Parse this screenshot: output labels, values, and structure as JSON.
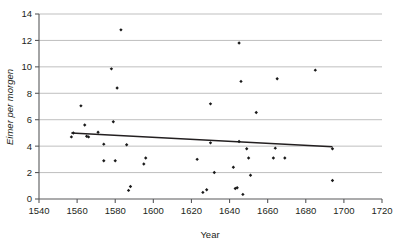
{
  "chart_data": {
    "type": "scatter",
    "title": "",
    "xlabel": "Year",
    "ylabel": "Eimer per morgen",
    "xlim": [
      1540,
      1720
    ],
    "ylim": [
      0,
      14
    ],
    "xticks": [
      1540,
      1560,
      1580,
      1600,
      1620,
      1640,
      1660,
      1680,
      1700,
      1720
    ],
    "yticks": [
      0,
      2,
      4,
      6,
      8,
      10,
      12,
      14
    ],
    "xtick_step": 20,
    "ytick_step": 2,
    "grid": "horizontal",
    "legend": "none",
    "marker": "small-filled-diamond",
    "marker_color": "#1a1a1a",
    "points": [
      {
        "x": 1557,
        "y": 4.7
      },
      {
        "x": 1558,
        "y": 5.0
      },
      {
        "x": 1562,
        "y": 7.05
      },
      {
        "x": 1564,
        "y": 5.6
      },
      {
        "x": 1565,
        "y": 4.75
      },
      {
        "x": 1566,
        "y": 4.7
      },
      {
        "x": 1571,
        "y": 5.05
      },
      {
        "x": 1574,
        "y": 4.15
      },
      {
        "x": 1574,
        "y": 2.9
      },
      {
        "x": 1578,
        "y": 9.85
      },
      {
        "x": 1579,
        "y": 5.85
      },
      {
        "x": 1580,
        "y": 2.9
      },
      {
        "x": 1581,
        "y": 8.4
      },
      {
        "x": 1583,
        "y": 12.8
      },
      {
        "x": 1586,
        "y": 4.1
      },
      {
        "x": 1587,
        "y": 0.65
      },
      {
        "x": 1588,
        "y": 0.95
      },
      {
        "x": 1595,
        "y": 2.65
      },
      {
        "x": 1596,
        "y": 3.1
      },
      {
        "x": 1623,
        "y": 3.0
      },
      {
        "x": 1626,
        "y": 0.5
      },
      {
        "x": 1628,
        "y": 0.7
      },
      {
        "x": 1630,
        "y": 7.2
      },
      {
        "x": 1630,
        "y": 4.25
      },
      {
        "x": 1632,
        "y": 2.0
      },
      {
        "x": 1642,
        "y": 2.4
      },
      {
        "x": 1643,
        "y": 0.8
      },
      {
        "x": 1644,
        "y": 0.85
      },
      {
        "x": 1645,
        "y": 4.35
      },
      {
        "x": 1645,
        "y": 11.8
      },
      {
        "x": 1646,
        "y": 8.9
      },
      {
        "x": 1647,
        "y": 0.35
      },
      {
        "x": 1649,
        "y": 3.8
      },
      {
        "x": 1650,
        "y": 3.1
      },
      {
        "x": 1651,
        "y": 1.8
      },
      {
        "x": 1654,
        "y": 6.55
      },
      {
        "x": 1663,
        "y": 3.1
      },
      {
        "x": 1664,
        "y": 3.85
      },
      {
        "x": 1665,
        "y": 9.1
      },
      {
        "x": 1669,
        "y": 3.1
      },
      {
        "x": 1685,
        "y": 9.75
      },
      {
        "x": 1694,
        "y": 3.8
      },
      {
        "x": 1694,
        "y": 1.4
      }
    ],
    "trendline": {
      "type": "linear",
      "x_start": 1557,
      "y_start": 5.0,
      "x_end": 1694,
      "y_end": 3.95,
      "color": "#231f20"
    }
  },
  "axes": {
    "y_title": "Eimer per morgen",
    "x_title": "Year",
    "ytick_labels": [
      "14",
      "12",
      "10",
      "8",
      "6",
      "4",
      "2",
      "0"
    ],
    "xtick_labels": [
      "1540",
      "1560",
      "1580",
      "1600",
      "1620",
      "1640",
      "1660",
      "1680",
      "1700",
      "1720"
    ]
  }
}
